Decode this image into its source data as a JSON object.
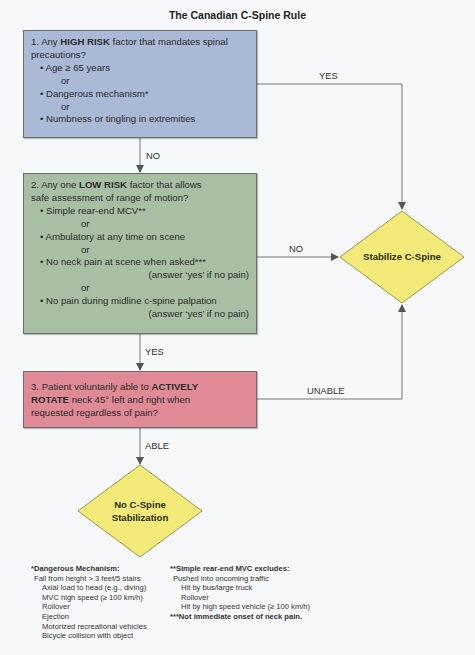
{
  "title": "The Canadian C-Spine Rule",
  "colors": {
    "high_risk_box": "#a9b9d6",
    "low_risk_box": "#a8bfa4",
    "rotate_box": "#e08a96",
    "decision_diamond": "#f4ea7a",
    "connector": "#777777"
  },
  "box1": {
    "prefix": "1. Any ",
    "emphasis": "HIGH RISK",
    "suffix": " factor that mandates spinal",
    "line2": "precautions?",
    "items": [
      "• Age ≥ 65 years",
      "or",
      "• Dangerous mechanism*",
      "or",
      "• Numbness or tingling in extremities"
    ]
  },
  "box2": {
    "prefix": "2. Any one ",
    "emphasis": "LOW RISK",
    "suffix": " factor that allows",
    "line2": "safe assessment of range of motion?",
    "items": [
      "• Simple rear-end MCV**",
      "or",
      "• Ambulatory at any time on scene",
      "or",
      "• No neck pain at scene when asked***",
      "(answer ‘yes’ if no pain)",
      "or",
      "• No pain during midline c-spine palpation",
      "(answer ‘yes’ if no pain)"
    ]
  },
  "box3": {
    "prefix": "3. Patient voluntarily able to ",
    "emphasis1": "ACTIVELY",
    "emphasis2": "ROTATE",
    "line2_suffix": " neck 45° left and right when",
    "line3": "requested regardless of pain?"
  },
  "arrows": {
    "box1_yes": "YES",
    "box1_no": "NO",
    "box2_no": "NO",
    "box2_yes": "YES",
    "box3_unable": "UNABLE",
    "box3_able": "ABLE"
  },
  "outcomes": {
    "stabilize": "Stabilize C-Spine",
    "no_stabilize_line1": "No C-Spine",
    "no_stabilize_line2": "Stabilization"
  },
  "footnotes": {
    "dangerous": {
      "heading": "*Dangerous Mechanism:",
      "items": [
        "Fall from height > 3 feet/5 stairs",
        "Axial load to head (e.g., diving)",
        "MVC high speed (≥ 100 km/h)",
        "Rollover",
        "Ejection",
        "Motorized recreational vehicles",
        "Bicycle collision with object"
      ]
    },
    "simple_rear_end": {
      "heading": "**Simple rear-end MVC excludes:",
      "items": [
        "Pushed into oncoming traffic",
        "Hit by bus/large truck",
        "Rollover",
        "Hit by high speed vehicle (≥ 100 km/h)"
      ]
    },
    "neck_pain": "***Not immediate onset of neck pain."
  }
}
